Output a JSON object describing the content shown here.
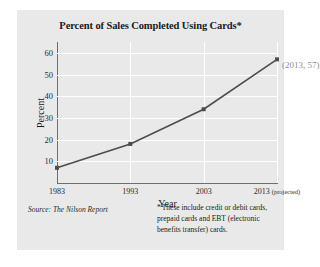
{
  "figure": {
    "title": "Percent of Sales Completed Using Cards*",
    "source_note": "Source: The Nilson Report",
    "footnote_marker": "*",
    "footnote_text": "These include credit or debit cards, prepaid cards and EBT (electronic benefits transfer) cards.",
    "background_color": "#e9e9e9",
    "gridline_color": "#ffffff",
    "axis_color": "#6e6e6e",
    "series_color": "#4d4d4d",
    "annotation_color": "#8c8c8c"
  },
  "chart_data": {
    "type": "line",
    "title": "Percent of Sales Completed Using Cards*",
    "xlabel": "Year",
    "ylabel": "Percent",
    "categories": [
      "1983",
      "1993",
      "2003",
      "2013"
    ],
    "x_tick_labels": [
      "1983",
      "1993",
      "2003",
      "2013"
    ],
    "x_tick_suffix": [
      "",
      "",
      "",
      "(projected)"
    ],
    "values": [
      7,
      18,
      34,
      57
    ],
    "ylim": [
      0,
      65
    ],
    "y_ticks": [
      10,
      20,
      30,
      40,
      50,
      60
    ],
    "grid": true,
    "legend": "none",
    "annotations": [
      {
        "label": "(2013, 57)",
        "x": "2013",
        "y": 57
      }
    ]
  }
}
